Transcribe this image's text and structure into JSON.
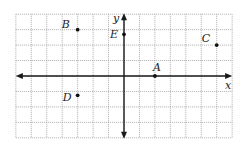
{
  "diagram": {
    "type": "coordinate-plane",
    "grid": {
      "x_min": -7,
      "x_max": 7,
      "y_min": -4,
      "y_max": 4,
      "step": 1,
      "origin_px": [
        124,
        76
      ],
      "unit_px": 15.45
    },
    "axes": {
      "x_label": "x",
      "y_label": "y"
    },
    "points": [
      {
        "name": "A",
        "x": 2,
        "y": 0,
        "label_dx": -2,
        "label_dy": -5
      },
      {
        "name": "B",
        "x": -3,
        "y": 3,
        "label_dx": -16,
        "label_dy": -2
      },
      {
        "name": "C",
        "x": 6,
        "y": 2,
        "label_dx": -15,
        "label_dy": -3
      },
      {
        "name": "D",
        "x": -3,
        "y": -1.25,
        "label_dx": -15,
        "label_dy": 6
      },
      {
        "name": "E",
        "x": 0,
        "y": 2.7,
        "label_dx": -14,
        "label_dy": 4
      }
    ],
    "colors": {
      "grid": "#9a9a9a",
      "axis": "#1a1a1a",
      "point": "#111111"
    }
  }
}
